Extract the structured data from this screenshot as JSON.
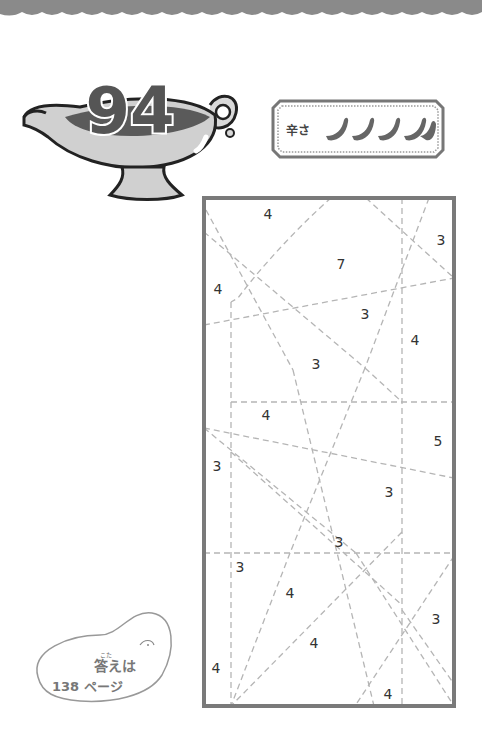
{
  "page": {
    "puzzle_number": "94",
    "difficulty": {
      "label": "辛さ",
      "icon": "chili-pepper-icon",
      "count": 5
    },
    "answer_note": {
      "ruby": "こた",
      "line1": "答えは",
      "line2": "138 ページ"
    }
  },
  "puzzle": {
    "type": "dashed-line region count puzzle",
    "frame": {
      "x": 204,
      "y": 198,
      "w": 250,
      "h": 508
    },
    "clues": [
      {
        "value": "4",
        "x": 268,
        "y": 214
      },
      {
        "value": "3",
        "x": 441,
        "y": 240
      },
      {
        "value": "7",
        "x": 341,
        "y": 264
      },
      {
        "value": "4",
        "x": 218,
        "y": 289
      },
      {
        "value": "3",
        "x": 365,
        "y": 314
      },
      {
        "value": "4",
        "x": 415,
        "y": 340
      },
      {
        "value": "3",
        "x": 316,
        "y": 364
      },
      {
        "value": "4",
        "x": 266,
        "y": 415
      },
      {
        "value": "5",
        "x": 438,
        "y": 441
      },
      {
        "value": "3",
        "x": 217,
        "y": 466
      },
      {
        "value": "3",
        "x": 389,
        "y": 492
      },
      {
        "value": "3",
        "x": 339,
        "y": 542
      },
      {
        "value": "3",
        "x": 240,
        "y": 567
      },
      {
        "value": "4",
        "x": 290,
        "y": 593
      },
      {
        "value": "3",
        "x": 436,
        "y": 619
      },
      {
        "value": "4",
        "x": 314,
        "y": 643
      },
      {
        "value": "4",
        "x": 216,
        "y": 668
      },
      {
        "value": "4",
        "x": 388,
        "y": 694
      }
    ]
  }
}
